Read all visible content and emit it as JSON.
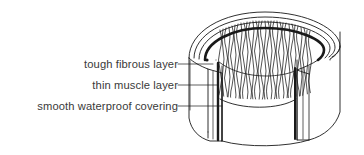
{
  "figure": {
    "background_color": "#ffffff",
    "line_color": "#1a1a1a",
    "text_color": "#3a3a3a",
    "labels": [
      {
        "id": "tough-fibrous-layer",
        "text": "tough fibrous layer"
      },
      {
        "id": "thin-muscle-layer",
        "text": "thin muscle layer"
      },
      {
        "id": "smooth-waterproof-covering",
        "text": "smooth waterproof covering"
      }
    ],
    "leader_lines": {
      "connector_x": 190,
      "rows_y": [
        64,
        85,
        106
      ],
      "endpoint_marker": "dot"
    },
    "diagram": {
      "type": "line-drawing",
      "shape": "cylinder-with-wedge-cutaway",
      "inner_texture": "wavy-vertical-lines",
      "wall_layers": [
        "tough fibrous layer",
        "thin muscle layer",
        "smooth waterproof covering"
      ]
    }
  }
}
